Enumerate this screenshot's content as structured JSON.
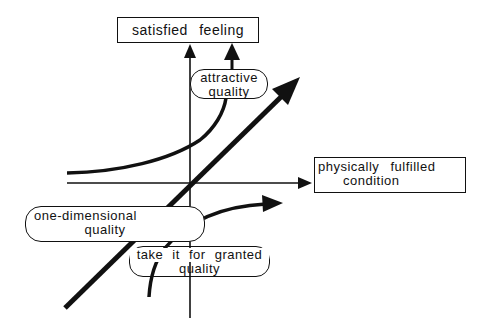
{
  "diagram": {
    "type": "kano-model",
    "y_axis": {
      "label": "satisfied feeling"
    },
    "x_axis": {
      "label_line1": "physically fulfilled",
      "label_line2": "condition"
    },
    "curves": [
      {
        "name": "attractive quality",
        "label_line1": "attractive",
        "label_line2": "quality"
      },
      {
        "name": "one-dimensional quality",
        "label_line1": "one-dimensional",
        "label_line2": "quality"
      },
      {
        "name": "take it for granted quality",
        "label_line1": "take it for granted",
        "label_line2": "quality"
      }
    ],
    "colors": {
      "stroke": "#111111",
      "background": "#ffffff"
    }
  }
}
